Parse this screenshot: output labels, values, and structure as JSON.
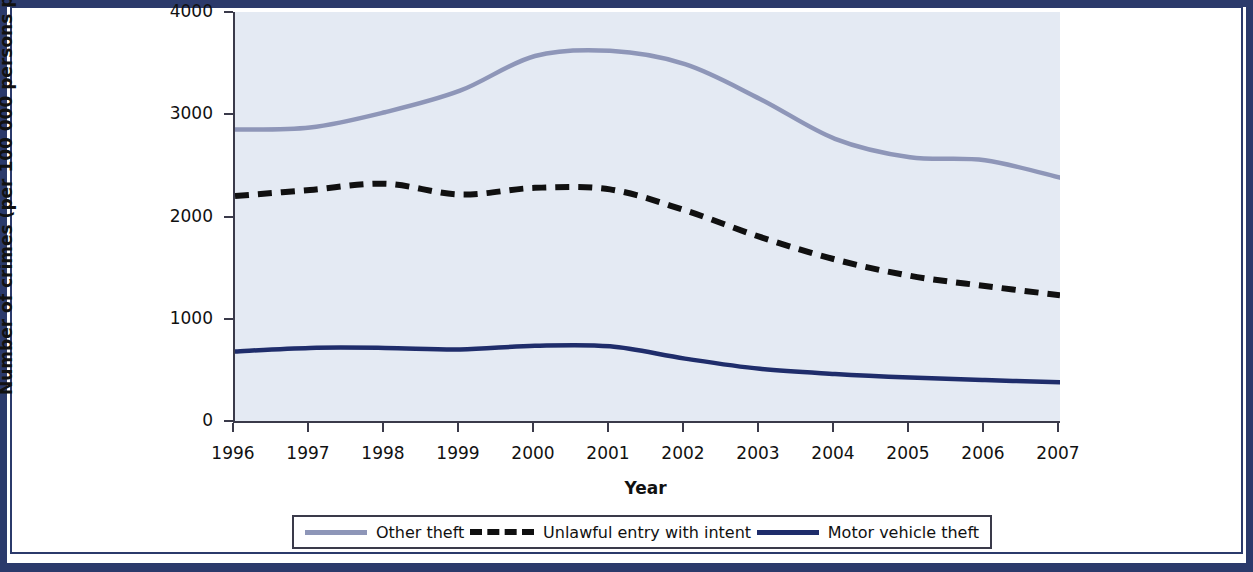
{
  "figure": {
    "background_color": "#ffffff",
    "frame_color": "#2b3a6b",
    "plot_background_color": "#e4eaf3",
    "axis_color": "#3a3a4a"
  },
  "axes": {
    "x_title": "Year",
    "y_title": "Number of crimes (per 100 000 persons per year)",
    "x_tick_labels": [
      "1996",
      "1997",
      "1998",
      "1999",
      "2000",
      "2001",
      "2002",
      "2003",
      "2004",
      "2005",
      "2006",
      "2007"
    ],
    "y_tick_labels": [
      "0",
      "1000",
      "2000",
      "3000",
      "4000"
    ]
  },
  "legend": {
    "position": "bottom",
    "entries": [
      {
        "label": "Other theft",
        "color": "#8e96b8",
        "style": "solid",
        "swatch": "line-solid-light"
      },
      {
        "label": "Unlawful entry with intent",
        "color": "#101010",
        "style": "dashed",
        "swatch": "line-dashed-black"
      },
      {
        "label": "Motor vehicle theft",
        "color": "#1f2d6b",
        "style": "solid",
        "swatch": "line-solid-navy"
      }
    ]
  },
  "chart_data": {
    "type": "line",
    "title": "",
    "xlabel": "Year",
    "ylabel": "Number of crimes (per 100 000 persons per year)",
    "x": [
      1996,
      1997,
      1998,
      1999,
      2000,
      2001,
      2002,
      2003,
      2004,
      2005,
      2006,
      2007
    ],
    "xlim": [
      1996,
      2007
    ],
    "ylim": [
      0,
      4000
    ],
    "yticks": [
      0,
      1000,
      2000,
      3000,
      4000
    ],
    "grid": false,
    "legend_position": "bottom",
    "series": [
      {
        "name": "Other theft",
        "color": "#8e96b8",
        "style": "solid",
        "values": [
          2850,
          2870,
          3020,
          3230,
          3570,
          3620,
          3490,
          3150,
          2760,
          2580,
          2550,
          2380
        ]
      },
      {
        "name": "Unlawful entry with intent",
        "color": "#101010",
        "style": "dashed",
        "values": [
          2200,
          2260,
          2320,
          2215,
          2280,
          2265,
          2060,
          1800,
          1580,
          1420,
          1320,
          1230
        ]
      },
      {
        "name": "Motor vehicle theft",
        "color": "#1f2d6b",
        "style": "solid",
        "values": [
          680,
          715,
          715,
          700,
          735,
          730,
          610,
          510,
          460,
          425,
          400,
          380
        ]
      }
    ]
  }
}
